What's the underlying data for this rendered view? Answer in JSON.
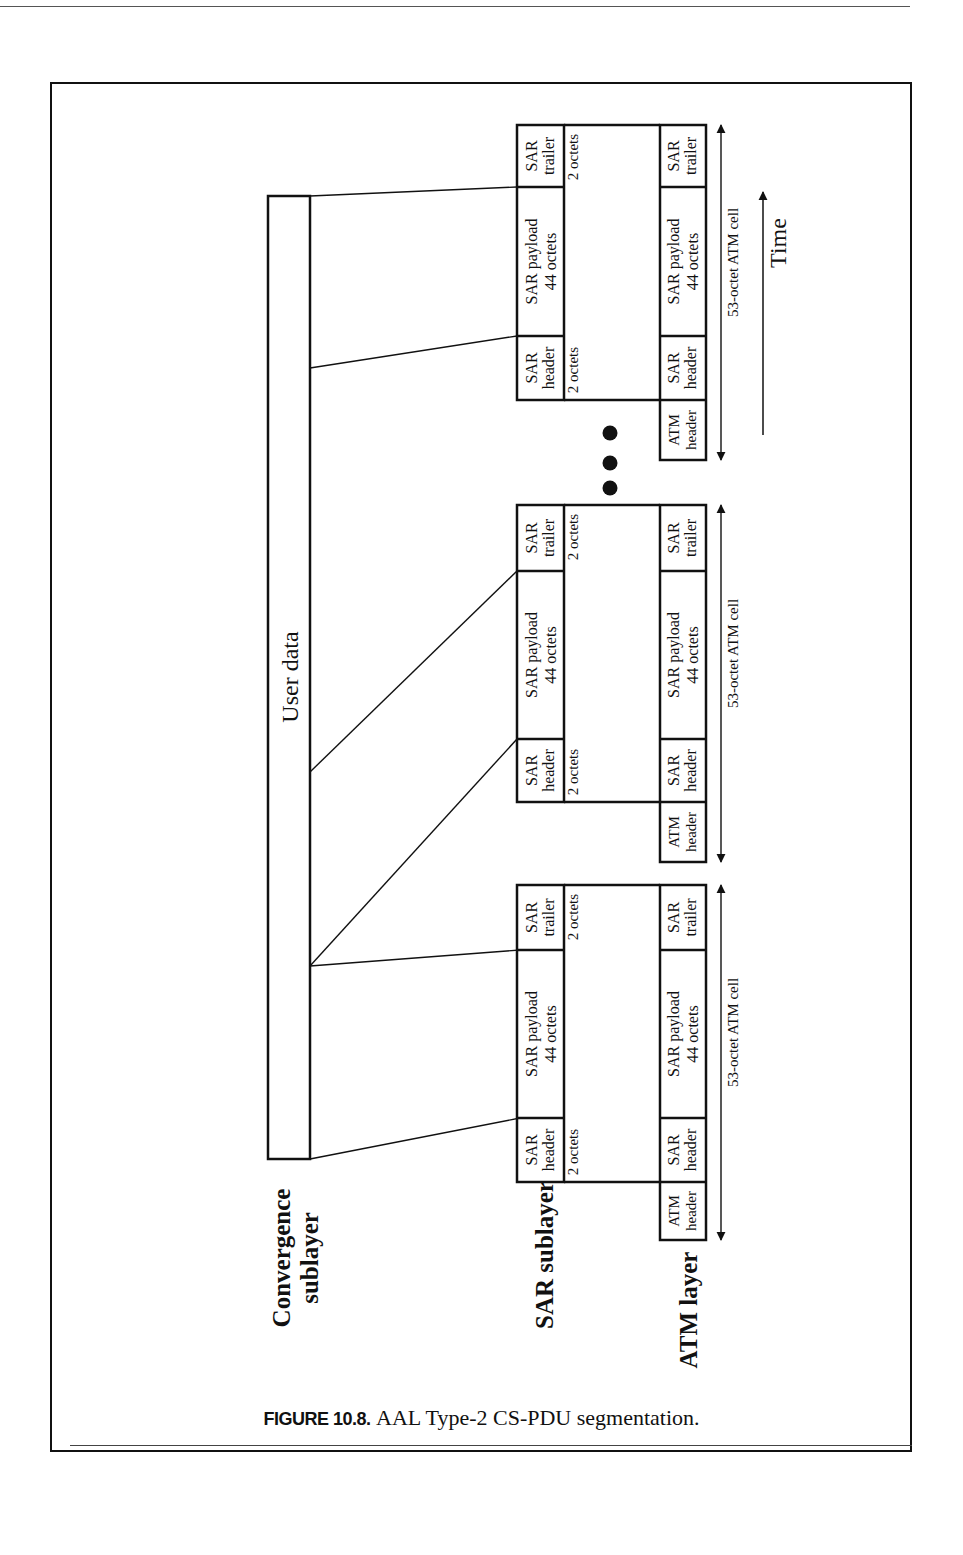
{
  "figure": {
    "number_label": "FIGURE 10.8.",
    "caption": "AAL Type-2 CS-PDU segmentation."
  },
  "layers": {
    "convergence": [
      "Convergence",
      "sublayer"
    ],
    "sar": "SAR sublayer",
    "atm": "ATM layer"
  },
  "user_data": "User data",
  "time_label": "Time",
  "cells": [
    {
      "sar": {
        "header": [
          "SAR",
          "header"
        ],
        "payload": [
          "SAR payload",
          "44 octets"
        ],
        "trailer": [
          "SAR",
          "trailer"
        ],
        "header_size": "2 octets",
        "trailer_size": "2 octets"
      },
      "atm": {
        "atm_header": [
          "ATM",
          "header"
        ],
        "sar_header": [
          "SAR",
          "header"
        ],
        "payload": [
          "SAR payload",
          "44 octets"
        ],
        "trailer": [
          "SAR",
          "trailer"
        ]
      },
      "cell_size": "53-octet ATM cell"
    },
    {
      "sar": {
        "header": [
          "SAR",
          "header"
        ],
        "payload": [
          "SAR payload",
          "44 octets"
        ],
        "trailer": [
          "SAR",
          "trailer"
        ],
        "header_size": "2 octets",
        "trailer_size": "2 octets"
      },
      "atm": {
        "atm_header": [
          "ATM",
          "header"
        ],
        "sar_header": [
          "SAR",
          "header"
        ],
        "payload": [
          "SAR payload",
          "44 octets"
        ],
        "trailer": [
          "SAR",
          "trailer"
        ]
      },
      "cell_size": "53-octet ATM cell"
    },
    {
      "sar": {
        "header": [
          "SAR",
          "header"
        ],
        "payload": [
          "SAR payload",
          "44 octets"
        ],
        "trailer": [
          "SAR",
          "trailer"
        ],
        "header_size": "2 octets",
        "trailer_size": "2 octets"
      },
      "atm": {
        "atm_header": [
          "ATM",
          "header"
        ],
        "sar_header": [
          "SAR",
          "header"
        ],
        "payload": [
          "SAR payload",
          "44 octets"
        ],
        "trailer": [
          "SAR",
          "trailer"
        ]
      },
      "cell_size": "53-octet ATM cell"
    }
  ],
  "ellipsis_dots": 3
}
